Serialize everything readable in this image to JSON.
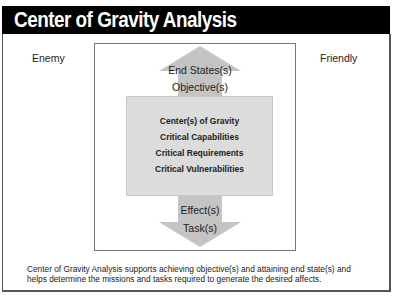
{
  "header": {
    "title": "Center of Gravity Analysis"
  },
  "sides": {
    "left_label": "Enemy",
    "right_label": "Friendly"
  },
  "up_arrow": {
    "labels": [
      "End States(s)",
      "Objective(s)"
    ]
  },
  "core_box": {
    "items": [
      "Center(s) of Gravity",
      "Critical Capabilities",
      "Critical Requirements",
      "Critical Vulnerabilities"
    ]
  },
  "down_arrow": {
    "labels": [
      "Effect(s)",
      "Task(s)"
    ]
  },
  "footer": {
    "text": "Center of Gravity Analysis supports achieving objective(s) and attaining end state(s) and helps determine the missions and tasks required to generate the desired affects."
  },
  "colors": {
    "header_bg": "#000000",
    "header_text": "#ffffff",
    "arrow_fill": "#c4c4c4",
    "core_box_fill": "#dcdcdc",
    "border": "#555555"
  }
}
